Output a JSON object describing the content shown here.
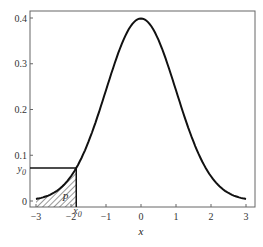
{
  "chart_data": {
    "type": "line",
    "title": "",
    "xlabel": "x",
    "ylabel": "",
    "xlim": [
      -3,
      3
    ],
    "ylim": [
      0,
      0.4
    ],
    "grid": false,
    "x_ticks": [
      "−3",
      "−2",
      "−1",
      "0",
      "1",
      "2",
      "3"
    ],
    "x_tick_values": [
      -3,
      -2,
      -1,
      0,
      1,
      2,
      3
    ],
    "y_ticks": [
      "0",
      "0.1",
      "0.2",
      "0.3",
      "0.4"
    ],
    "y_tick_values": [
      0,
      0.1,
      0.2,
      0.3,
      0.4
    ],
    "series": [
      {
        "name": "standard normal pdf",
        "x": [
          -3,
          -2.5,
          -2,
          -1.5,
          -1,
          -0.5,
          0,
          0.5,
          1,
          1.5,
          2,
          2.5,
          3
        ],
        "values": [
          0.004,
          0.018,
          0.054,
          0.13,
          0.242,
          0.352,
          0.399,
          0.352,
          0.242,
          0.13,
          0.054,
          0.018,
          0.004
        ]
      }
    ],
    "annotations": {
      "x0_label": "x",
      "x0_sub": "0",
      "x0_value": -1.85,
      "y0_label": "y",
      "y0_sub": "0",
      "y0_value": 0.072,
      "area_label": "P",
      "area_description": "hatched area under curve from x = −3 to x0"
    }
  }
}
